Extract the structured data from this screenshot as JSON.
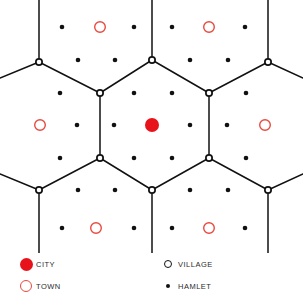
{
  "figure": {
    "title": "",
    "type": "central-place-hexagon-lattice",
    "background_color": "#ffffff"
  },
  "colors": {
    "city_fill": "#e8131a",
    "town_stroke": "#e8493f",
    "village_stroke": "#111111",
    "village_fill": "#ffffff",
    "hamlet_fill": "#111111",
    "lattice_line": "#111111",
    "label_text": "#2b2b2b"
  },
  "legend": {
    "left_column": [
      {
        "symbol": "filled-red-circle",
        "icon": "city-icon",
        "label": "CITY"
      },
      {
        "symbol": "open-red-circle",
        "icon": "town-icon",
        "label": "TOWN"
      }
    ],
    "right_column": [
      {
        "symbol": "open-black-circle",
        "icon": "village-icon",
        "label": "VILLAGE"
      },
      {
        "symbol": "small-filled-black-dot",
        "icon": "hamlet-icon",
        "label": "HAMLET"
      }
    ]
  },
  "chart_data": {
    "type": "scatter",
    "title": "",
    "subtitle": "",
    "xlabel": "",
    "ylabel": "",
    "xlim": [
      0,
      303
    ],
    "ylim": [
      0,
      253
    ],
    "grid": false,
    "legend_position": "bottom",
    "geometry": {
      "hex_center_x": 152,
      "hex_center_y": 125,
      "hex_circumradius": 65,
      "hex_half_width": 56.5,
      "hex_half_height": 32.5,
      "column_pitch": 37.8,
      "row_pitch": 32.5
    },
    "series": [
      {
        "name": "CITY",
        "marker": "filled-circle",
        "color": "#e8131a",
        "radius": 7,
        "points": [
          {
            "x": 152,
            "y": 125
          }
        ]
      },
      {
        "name": "TOWN",
        "marker": "open-circle",
        "color": "#e8493f",
        "radius": 6,
        "points": [
          {
            "x": 100,
            "y": 27
          },
          {
            "x": 209,
            "y": 27
          },
          {
            "x": 40,
            "y": 125
          },
          {
            "x": 265,
            "y": 125
          },
          {
            "x": 96,
            "y": 228
          },
          {
            "x": 209,
            "y": 228
          }
        ]
      },
      {
        "name": "VILLAGE",
        "marker": "open-circle",
        "color": "#111111",
        "radius": 4,
        "points": [
          {
            "x": 39,
            "y": 62
          },
          {
            "x": 152,
            "y": 60
          },
          {
            "x": 268,
            "y": 62
          },
          {
            "x": 100,
            "y": 93
          },
          {
            "x": 209,
            "y": 93
          },
          {
            "x": 100,
            "y": 158
          },
          {
            "x": 209,
            "y": 158
          },
          {
            "x": 39,
            "y": 190
          },
          {
            "x": 152,
            "y": 190
          },
          {
            "x": 268,
            "y": 190
          }
        ]
      },
      {
        "name": "HAMLET",
        "marker": "filled-dot",
        "color": "#111111",
        "radius": 2.3,
        "points": [
          {
            "x": 62,
            "y": 27
          },
          {
            "x": 134,
            "y": 27
          },
          {
            "x": 172,
            "y": 27
          },
          {
            "x": 245,
            "y": 27
          },
          {
            "x": 78,
            "y": 60
          },
          {
            "x": 115,
            "y": 60
          },
          {
            "x": 190,
            "y": 60
          },
          {
            "x": 228,
            "y": 60
          },
          {
            "x": 60,
            "y": 93
          },
          {
            "x": 134,
            "y": 93
          },
          {
            "x": 172,
            "y": 93
          },
          {
            "x": 246,
            "y": 93
          },
          {
            "x": 77,
            "y": 125
          },
          {
            "x": 114,
            "y": 125
          },
          {
            "x": 190,
            "y": 125
          },
          {
            "x": 227,
            "y": 125
          },
          {
            "x": 60,
            "y": 158
          },
          {
            "x": 134,
            "y": 158
          },
          {
            "x": 172,
            "y": 158
          },
          {
            "x": 246,
            "y": 158
          },
          {
            "x": 78,
            "y": 190
          },
          {
            "x": 115,
            "y": 190
          },
          {
            "x": 190,
            "y": 190
          },
          {
            "x": 228,
            "y": 190
          },
          {
            "x": 62,
            "y": 228
          },
          {
            "x": 134,
            "y": 228
          },
          {
            "x": 172,
            "y": 228
          },
          {
            "x": 245,
            "y": 228
          }
        ]
      }
    ],
    "lattice_edges": [
      {
        "x1": 39,
        "y1": 0,
        "x2": 39,
        "y2": 62
      },
      {
        "x1": 152,
        "y1": 0,
        "x2": 152,
        "y2": 60
      },
      {
        "x1": 268,
        "y1": 0,
        "x2": 268,
        "y2": 62
      },
      {
        "x1": 0,
        "y1": 78,
        "x2": 39,
        "y2": 62
      },
      {
        "x1": 39,
        "y1": 62,
        "x2": 100,
        "y2": 93
      },
      {
        "x1": 100,
        "y1": 93,
        "x2": 152,
        "y2": 60
      },
      {
        "x1": 152,
        "y1": 60,
        "x2": 209,
        "y2": 93
      },
      {
        "x1": 209,
        "y1": 93,
        "x2": 268,
        "y2": 62
      },
      {
        "x1": 268,
        "y1": 62,
        "x2": 303,
        "y2": 78
      },
      {
        "x1": 100,
        "y1": 93,
        "x2": 100,
        "y2": 158
      },
      {
        "x1": 209,
        "y1": 93,
        "x2": 209,
        "y2": 158
      },
      {
        "x1": 0,
        "y1": 174,
        "x2": 39,
        "y2": 190
      },
      {
        "x1": 39,
        "y1": 190,
        "x2": 100,
        "y2": 158
      },
      {
        "x1": 100,
        "y1": 158,
        "x2": 152,
        "y2": 190
      },
      {
        "x1": 152,
        "y1": 190,
        "x2": 209,
        "y2": 158
      },
      {
        "x1": 209,
        "y1": 158,
        "x2": 268,
        "y2": 190
      },
      {
        "x1": 268,
        "y1": 190,
        "x2": 303,
        "y2": 174
      },
      {
        "x1": 39,
        "y1": 190,
        "x2": 39,
        "y2": 253
      },
      {
        "x1": 152,
        "y1": 190,
        "x2": 152,
        "y2": 253
      },
      {
        "x1": 268,
        "y1": 190,
        "x2": 268,
        "y2": 253
      }
    ]
  }
}
